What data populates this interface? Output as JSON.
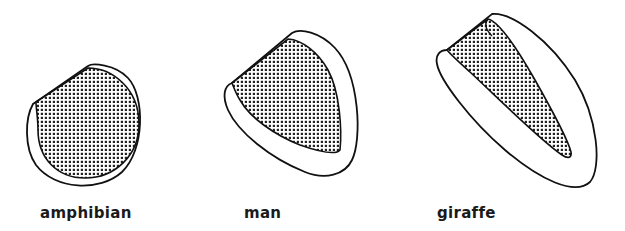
{
  "figure": {
    "panels": [
      {
        "id": "amphibian",
        "label": "amphibian",
        "description": "Heart ventricle with thin wall and large shaded cavity"
      },
      {
        "id": "man",
        "label": "man",
        "description": "Heart ventricle with moderate wall thickness and shaded cavity"
      },
      {
        "id": "giraffe",
        "label": "giraffe",
        "description": "Heart ventricle with very thick wall and narrow shaded cavity"
      }
    ],
    "colors": {
      "outline": "#111111",
      "background": "#ffffff",
      "stipple": "#222222"
    }
  }
}
